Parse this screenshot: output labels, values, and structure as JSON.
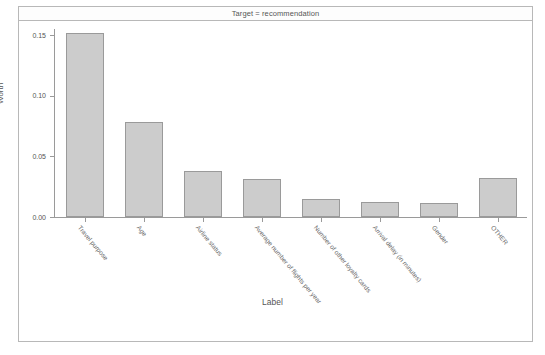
{
  "chart_data": {
    "type": "bar",
    "title": "Target = recommendation",
    "xlabel": "Label",
    "ylabel": "Worth",
    "ylim": [
      0,
      0.155
    ],
    "grid": false,
    "legend": null,
    "ytick_labels": [
      "0.15",
      "0.10",
      "0.05",
      "0.00"
    ],
    "ytick_values": [
      0.15,
      0.1,
      0.05,
      0.0
    ],
    "categories": [
      "Travel purpose",
      "Age",
      "Airline status",
      "Average number of flights per year",
      "Number of other loyalty cards",
      "Arrival delay (in minutes)",
      "Gender",
      "OTHER"
    ],
    "values": [
      0.152,
      0.078,
      0.038,
      0.031,
      0.0145,
      0.012,
      0.0115,
      0.032
    ],
    "bar_fill_color": "#cccccc",
    "bar_edge_color": "#9a9a9a"
  }
}
